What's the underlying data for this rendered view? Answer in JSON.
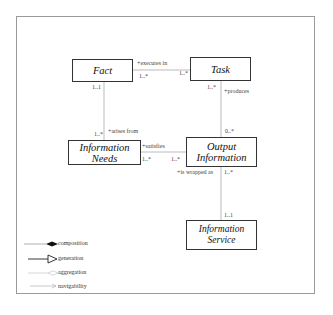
{
  "diagram": {
    "classes": [
      {
        "id": "fact",
        "name": "Fact"
      },
      {
        "id": "task",
        "name": "Task"
      },
      {
        "id": "information_needs",
        "name": "Information Needs"
      },
      {
        "id": "output_information",
        "name": "Output Information"
      },
      {
        "id": "information_service",
        "name": "Information Service"
      }
    ],
    "associations": [
      {
        "from": "fact",
        "to": "task",
        "role": "+executes in",
        "from_multiplicity": "1..*",
        "to_multiplicity": "1..*"
      },
      {
        "from": "task",
        "to": "output_information",
        "role": "+produces",
        "from_multiplicity": "1..*",
        "to_multiplicity": "0..*"
      },
      {
        "from": "fact",
        "to": "information_needs",
        "role": "+arises from",
        "from_multiplicity": "1..1",
        "to_multiplicity": "1..*"
      },
      {
        "from": "information_needs",
        "to": "output_information",
        "role": "+satisfies",
        "from_multiplicity": "1..*",
        "to_multiplicity": "1..*"
      },
      {
        "from": "output_information",
        "to": "information_service",
        "role": "+is wrapped as",
        "from_multiplicity": "1..*",
        "to_multiplicity": "1..1"
      }
    ],
    "legend": [
      {
        "icon": "composition-icon",
        "label": "composition"
      },
      {
        "icon": "generation-icon",
        "label": "generation"
      },
      {
        "icon": "aggregation-icon",
        "label": "aggregation"
      },
      {
        "icon": "navigability-icon",
        "label": "navigability"
      }
    ],
    "colors": {
      "box_border": "#333333",
      "link": "#aaaaaa",
      "frame": "#9a9a9a"
    }
  }
}
